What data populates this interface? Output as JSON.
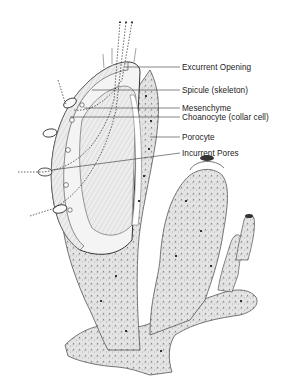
{
  "diagram": {
    "labels": [
      {
        "id": "excurrent-opening",
        "text": "Excurrent Opening",
        "x": 182,
        "y": 63,
        "line_from": [
          125,
          67
        ],
        "line_to": [
          180,
          67
        ]
      },
      {
        "id": "spicule",
        "text": "Spicule (skeleton)",
        "x": 182,
        "y": 86,
        "line_from": [
          92,
          90
        ],
        "line_to": [
          180,
          90
        ]
      },
      {
        "id": "mesenchyme",
        "text": "Mesenchyme",
        "x": 182,
        "y": 104,
        "line_from": [
          84,
          108
        ],
        "line_to": [
          180,
          108
        ]
      },
      {
        "id": "choanocyte",
        "text": "Choanocyte (collar cell)",
        "x": 182,
        "y": 113,
        "line_from": [
          70,
          117
        ],
        "line_to": [
          180,
          117
        ]
      },
      {
        "id": "porocyte",
        "text": "Porocyte",
        "x": 182,
        "y": 133,
        "line_from": [
          150,
          137
        ],
        "line_to": [
          180,
          137
        ]
      },
      {
        "id": "incurrent-pores",
        "text": "Incurrent Pores",
        "x": 182,
        "y": 150,
        "line_from": [
          52,
          170
        ],
        "line_to": [
          180,
          153
        ]
      }
    ],
    "colors": {
      "ink": "#222222",
      "shade": "#9a9a9a",
      "light": "#e6e6e6",
      "background": "#ffffff"
    }
  }
}
